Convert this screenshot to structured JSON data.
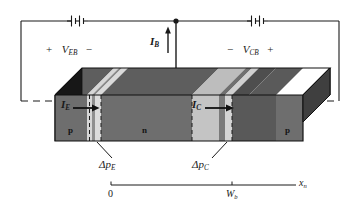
{
  "figure": {
    "kind": "pnp-bipolar-junction-transistor-diagram"
  },
  "circuit": {
    "emitter_bias_label_prefix": "+",
    "emitter_bias_symbol": "V",
    "emitter_bias_subscript": "EB",
    "emitter_bias_label_suffix": "−",
    "collector_bias_label_prefix": "−",
    "collector_bias_symbol": "V",
    "collector_bias_subscript": "CB",
    "collector_bias_label_suffix": "+",
    "battery_left_name": "battery-emitter-base",
    "battery_right_name": "battery-collector-base"
  },
  "currents": {
    "base": {
      "symbol": "I",
      "subscript": "B"
    },
    "emitter": {
      "symbol": "I",
      "subscript": "E"
    },
    "collector": {
      "symbol": "I",
      "subscript": "C"
    }
  },
  "regions": {
    "emitter_letter": "p",
    "base_letter": "n",
    "collector_letter": "p"
  },
  "annotations": {
    "delta_p_emitter_symbol": "Δp",
    "delta_p_emitter_subscript": "E",
    "delta_p_collector_symbol": "Δp",
    "delta_p_collector_subscript": "C"
  },
  "axis": {
    "origin_label": "0",
    "base_width_symbol": "W",
    "base_width_subscript": "b",
    "axis_symbol": "x",
    "axis_subscript": "n"
  },
  "colors": {
    "line": "#1a1a1a",
    "face_dark": "#6b6b6b",
    "face_darker": "#4a4a4a",
    "face_light": "#c9c9c9",
    "face_lighter": "#dcdcdc",
    "face_black": "#161616",
    "top_dark": "#5a5a5a",
    "top_light": "#bdbdbd",
    "background": "#ffffff"
  }
}
